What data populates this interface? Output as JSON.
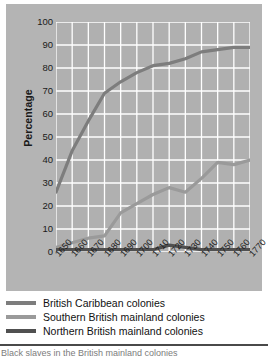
{
  "figure": {
    "background": "#ffffff",
    "panel_color": "#b4b4b4",
    "plot_color": "#b0b0b0",
    "gridline_color": "#ffffff"
  },
  "axes": {
    "y_title": "Percentage",
    "y_ticks": [
      "100",
      "90",
      "80",
      "70",
      "60",
      "50",
      "40",
      "30",
      "20",
      "10",
      "0"
    ],
    "x_ticks": [
      "1650",
      "1660",
      "1670",
      "1680",
      "1690",
      "1700",
      "1710",
      "1720",
      "1730",
      "1740",
      "1750",
      "1760",
      "1770"
    ]
  },
  "legend": {
    "items": [
      {
        "label": "British Caribbean colonies",
        "color": "#7d7d7d"
      },
      {
        "label": "Southern British mainland colonies",
        "color": "#9a9a9a"
      },
      {
        "label": "Northern British mainland colonies",
        "color": "#505050"
      }
    ]
  },
  "footer": {
    "caption": "Black slaves in the British mainland colonies"
  },
  "chart_data": {
    "type": "line",
    "title": "",
    "subtitle": "",
    "xlabel": "",
    "ylabel": "Percentage",
    "xlim": [
      1650,
      1770
    ],
    "ylim": [
      0,
      100
    ],
    "yticks": [
      0,
      10,
      20,
      30,
      40,
      50,
      60,
      70,
      80,
      90,
      100
    ],
    "grid": true,
    "legend_position": "below",
    "x": [
      1650,
      1660,
      1670,
      1680,
      1690,
      1700,
      1710,
      1720,
      1730,
      1740,
      1750,
      1760,
      1770
    ],
    "series": [
      {
        "name": "British Caribbean colonies",
        "color": "#7d7d7d",
        "values": [
          26,
          44,
          57,
          69,
          74,
          78,
          81,
          82,
          84,
          87,
          88,
          89,
          89
        ]
      },
      {
        "name": "Southern British mainland colonies",
        "color": "#9a9a9a",
        "values": [
          2,
          4,
          6,
          7,
          17,
          21,
          25,
          28,
          26,
          32,
          39,
          38,
          40
        ]
      },
      {
        "name": "Northern British mainland colonies",
        "color": "#505050",
        "values": [
          1,
          1,
          1,
          1,
          1,
          1,
          1,
          3,
          2,
          1,
          1,
          1,
          1
        ]
      }
    ]
  }
}
